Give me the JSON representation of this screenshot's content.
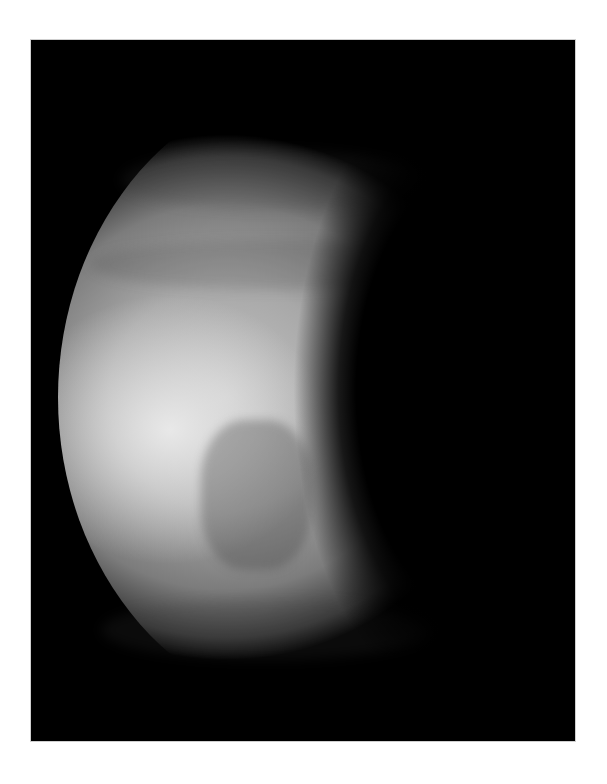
{
  "image": {
    "subject": "planet-gibbous-phase",
    "description": "Grayscale image of a cloud-covered planet in gibbous phase on black background",
    "colors": {
      "page_background": "#ffffff",
      "frame_background": "#000000",
      "planet_highlight": "#e6e6e6",
      "planet_midtone": "#9a9a9a",
      "planet_shadow": "#3a3a3a"
    }
  }
}
